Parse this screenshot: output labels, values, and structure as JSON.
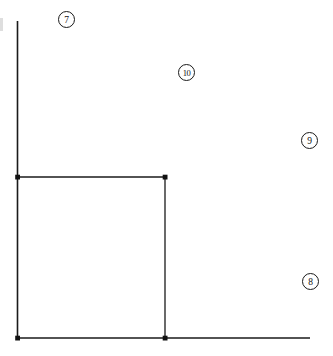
{
  "canvas": {
    "width": 333,
    "height": 356,
    "background": "#ffffff",
    "stroke_color": "#1a1a1a"
  },
  "axes": {
    "y_axis": {
      "name": "vertical-axis",
      "x": 17.5,
      "y_top": 21,
      "y_bottom": 338,
      "stroke_width": 1.6
    },
    "x_axis": {
      "name": "horizontal-axis",
      "y": 338,
      "x_left": 17.5,
      "x_right": 310,
      "stroke_width": 1.6
    }
  },
  "region": {
    "label": "rectangle",
    "x": 17.5,
    "y": 177,
    "width": 147.5,
    "height": 161,
    "stroke_width": 1.3,
    "fill": "none",
    "corner_markers": [
      {
        "name": "corner-marker-top-left",
        "x": 17.5,
        "y": 177
      },
      {
        "name": "corner-marker-top-right",
        "x": 165,
        "y": 177
      },
      {
        "name": "corner-marker-bottom-right",
        "x": 165,
        "y": 338
      }
    ]
  },
  "callouts": [
    {
      "id": "callout-7",
      "label": "7",
      "x": 58,
      "y": 11
    },
    {
      "id": "callout-10",
      "label": "10",
      "x": 178,
      "y": 64
    },
    {
      "id": "callout-9",
      "label": "9",
      "x": 301,
      "y": 132
    },
    {
      "id": "callout-8",
      "label": "8",
      "x": 302,
      "y": 273
    }
  ],
  "artifacts": {
    "left_edge_mark": "partial-cropped-mark"
  }
}
